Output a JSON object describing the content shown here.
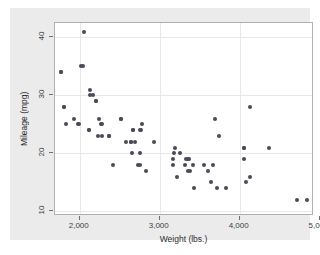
{
  "figure": {
    "background_color": "#ffffff",
    "graph_region_color": "#ebebeb",
    "plot_region_color": "#ffffff",
    "marker_color": "#4a4a58",
    "grid_color": "#e8e8e8",
    "frame_color": "#b0b0b0"
  },
  "chart_data": {
    "type": "scatter",
    "title": "",
    "xlabel": "Weight (lbs.)",
    "ylabel": "Mileage (mpg)",
    "xlim": [
      1690,
      4930
    ],
    "ylim": [
      9.2,
      42.5
    ],
    "xticks": [
      2000,
      3000,
      4000,
      5000
    ],
    "xticklabels": [
      "2,000",
      "3,000",
      "4,000",
      "5,000"
    ],
    "yticks": [
      10,
      20,
      30,
      40
    ],
    "yticklabels": [
      "10",
      "20",
      "30",
      "40"
    ],
    "grid": "both",
    "legend": "none",
    "series": [
      {
        "name": "mpg vs weight",
        "marker": "circle",
        "color": "#4a4a58",
        "x": [
          2930,
          3350,
          2640,
          3250,
          4080,
          3670,
          3690,
          3180,
          3220,
          4060,
          3600,
          3740,
          4130,
          4840,
          4720,
          3830,
          2580,
          4060,
          3720,
          3370,
          2730,
          4130,
          4370,
          4054,
          3560,
          3330,
          2260,
          3640,
          2750,
          3170,
          2120,
          2520,
          2650,
          2200,
          2370,
          2020,
          2280,
          2750,
          3430,
          3420,
          3195,
          3380,
          1800,
          1760,
          2670,
          2130,
          2160,
          2040,
          1930,
          1990,
          3350,
          2640,
          2830,
          2690,
          3310,
          2200,
          2670,
          2130,
          2780,
          1800,
          1830,
          2120,
          1760,
          2050,
          2410,
          2230,
          3170,
          2370,
          2280,
          2750,
          2240,
          2520,
          1980,
          2760
        ],
        "y": [
          22,
          17,
          22,
          20,
          15,
          18,
          26,
          20,
          16,
          19,
          17,
          23,
          28,
          12,
          12,
          14,
          22,
          21,
          14,
          19,
          18,
          16,
          21,
          21,
          18,
          19,
          25,
          15,
          18,
          18,
          24,
          26,
          20,
          29,
          23,
          35,
          23,
          24,
          14,
          18,
          21,
          17,
          28,
          34,
          24,
          30,
          30,
          35,
          26,
          25,
          19,
          22,
          17,
          22,
          18,
          29,
          24,
          31,
          25,
          28,
          25,
          24,
          34,
          41,
          18,
          23,
          19,
          23,
          25,
          20,
          26,
          26,
          25,
          24
        ]
      }
    ]
  },
  "axes": {
    "x_title": "Weight (lbs.)",
    "y_title": "Mileage (mpg)"
  }
}
